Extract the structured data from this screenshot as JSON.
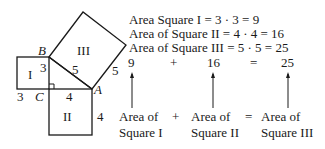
{
  "diagram": {
    "vertices": {
      "A": "A",
      "B": "B",
      "C": "C"
    },
    "squares": {
      "I": {
        "label": "I",
        "side": "3",
        "side_left_label": "3",
        "side_bottom_label": "3"
      },
      "II": {
        "label": "II",
        "side_top_label": "4",
        "side_right_label": "4"
      },
      "III": {
        "label": "III",
        "hyp_label": "5",
        "side_label": "5"
      }
    }
  },
  "equations": {
    "line1": "Area Square I = 3 · 3 = 9",
    "line2": "Area of Square II = 4 · 4 = 16",
    "line3": "Area of Square III = 5 · 5 = 25"
  },
  "sum": {
    "term1": "9",
    "plus": "+",
    "term2": "16",
    "equals": "=",
    "term3": "25"
  },
  "captions": {
    "c1_line1": "Area of",
    "c1_line2": "Square I",
    "plus": "+",
    "c2_line1": "Area of",
    "c2_line2": "Square II",
    "equals": "=",
    "c3_line1": "Area of",
    "c3_line2": "Square III"
  }
}
